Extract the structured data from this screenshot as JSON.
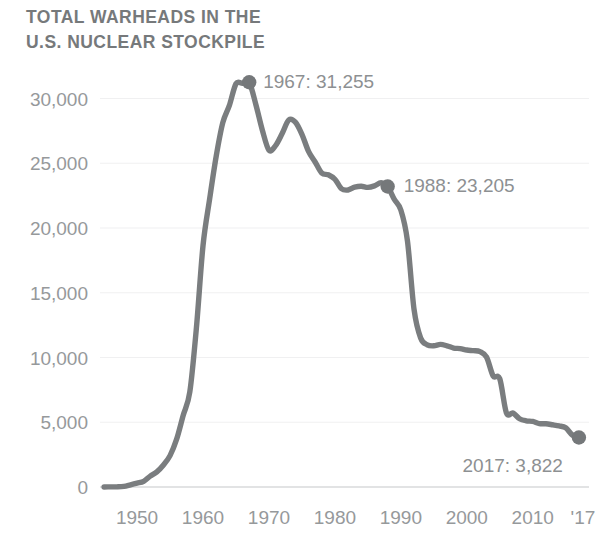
{
  "chart_data": {
    "type": "line",
    "title": "TOTAL WARHEADS IN THE U.S. NUCLEAR STOCKPILE",
    "title_lines": [
      "TOTAL WARHEADS IN THE",
      "U.S. NUCLEAR STOCKPILE"
    ],
    "xlabel": "",
    "ylabel": "",
    "xlim": [
      1944,
      2018
    ],
    "ylim": [
      0,
      32500
    ],
    "grid": "horizontal-faint",
    "legend": "none",
    "line_color": "#7a7d7f",
    "text_color": "#8d9092",
    "background": "#ffffff",
    "ytick_labels": [
      "0",
      "5,000",
      "10,000",
      "15,000",
      "20,000",
      "25,000",
      "30,000"
    ],
    "ytick_values": [
      0,
      5000,
      10000,
      15000,
      20000,
      25000,
      30000
    ],
    "xtick_labels": [
      "1950",
      "1960",
      "1970",
      "1980",
      "1990",
      "2000",
      "2010",
      "'17"
    ],
    "xtick_values": [
      1950,
      1960,
      1970,
      1980,
      1990,
      2000,
      2010,
      2017
    ],
    "series": [
      {
        "name": "U.S. nuclear stockpile",
        "x": [
          1945,
          1946,
          1947,
          1948,
          1949,
          1950,
          1951,
          1952,
          1953,
          1954,
          1955,
          1956,
          1957,
          1958,
          1959,
          1960,
          1961,
          1962,
          1963,
          1964,
          1965,
          1966,
          1967,
          1968,
          1969,
          1970,
          1971,
          1972,
          1973,
          1974,
          1975,
          1976,
          1977,
          1978,
          1979,
          1980,
          1981,
          1982,
          1983,
          1984,
          1985,
          1986,
          1987,
          1988,
          1989,
          1990,
          1991,
          1992,
          1993,
          1994,
          1995,
          1996,
          1997,
          1998,
          1999,
          2000,
          2001,
          2002,
          2003,
          2004,
          2005,
          2006,
          2007,
          2008,
          2009,
          2010,
          2011,
          2012,
          2013,
          2014,
          2015,
          2016,
          2017
        ],
        "y": [
          2,
          9,
          13,
          50,
          170,
          299,
          438,
          841,
          1169,
          1703,
          2422,
          3692,
          5543,
          7345,
          12298,
          18638,
          22229,
          25540,
          28133,
          29463,
          31139,
          31175,
          31255,
          29561,
          27552,
          26008,
          26365,
          27296,
          28335,
          28170,
          27235,
          25914,
          25099,
          24243,
          24107,
          23764,
          23031,
          22937,
          23154,
          23228,
          23135,
          23254,
          23490,
          23205,
          22217,
          21392,
          19008,
          13708,
          11511,
          10979,
          10904,
          11011,
          10903,
          10732,
          10685,
          10577,
          10526,
          10457,
          10027,
          8570,
          8360,
          5736,
          5709,
          5273,
          5113,
          5066,
          4897,
          4881,
          4804,
          4717,
          4571,
          4018,
          3822
        ]
      }
    ],
    "annotations": [
      {
        "label": "1967: 31,255",
        "year": 1967,
        "value": 31255,
        "marker": true
      },
      {
        "label": "1988: 23,205",
        "year": 1988,
        "value": 23205,
        "marker": true
      },
      {
        "label": "2017: 3,822",
        "year": 2017,
        "value": 3822,
        "marker": true
      }
    ]
  }
}
